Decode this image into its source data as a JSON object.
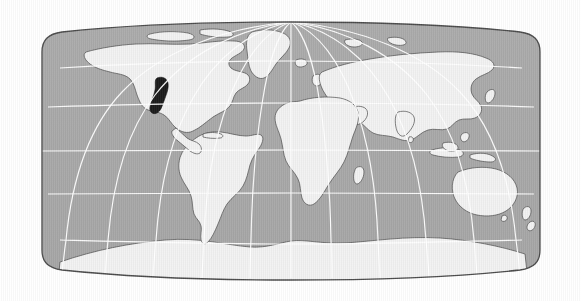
{
  "figure": {
    "kind": "world-map",
    "projection": "robinson",
    "background_color": "#ffffff"
  },
  "map": {
    "bounds": {
      "x": 42,
      "y": 22,
      "width": 498,
      "height": 258
    },
    "ocean_color": "#a9a9a9",
    "land_color": "#f2f2f2",
    "coastline_color": "#4a4a4a",
    "graticule_color": "#ffffff",
    "outline_color": "#4a4a4a",
    "highlight_color": "#1a1a1a"
  },
  "graticule": {
    "visible": true,
    "parallels": [
      {
        "label": "60N",
        "degrees": 60,
        "y": 68
      },
      {
        "label": "30N",
        "degrees": 30,
        "y": 107
      },
      {
        "label": "0",
        "degrees": 0,
        "y": 151
      },
      {
        "label": "30S",
        "degrees": -30,
        "y": 194
      },
      {
        "label": "60S",
        "degrees": -60,
        "y": 240
      }
    ],
    "meridians": [
      {
        "label": "150W",
        "degrees": -150
      },
      {
        "label": "120W",
        "degrees": -120
      },
      {
        "label": "90W",
        "degrees": -90
      },
      {
        "label": "60W",
        "degrees": -60
      },
      {
        "label": "30W",
        "degrees": -30
      },
      {
        "label": "0",
        "degrees": 0
      },
      {
        "label": "30E",
        "degrees": 30
      },
      {
        "label": "60E",
        "degrees": 60
      },
      {
        "label": "90E",
        "degrees": 90
      },
      {
        "label": "120E",
        "degrees": 120
      },
      {
        "label": "150E",
        "degrees": 150
      }
    ],
    "interval_degrees": 30
  },
  "highlight": {
    "name": "highlighted-region",
    "description": "Filled dark region over the western and central United States",
    "fill": "#1a1a1a",
    "bbox": {
      "x": 150,
      "y": 77,
      "width": 20,
      "height": 37
    }
  },
  "landmasses": [
    {
      "name": "north-america"
    },
    {
      "name": "south-america"
    },
    {
      "name": "greenland"
    },
    {
      "name": "europe"
    },
    {
      "name": "africa"
    },
    {
      "name": "asia"
    },
    {
      "name": "australia"
    },
    {
      "name": "antarctica"
    },
    {
      "name": "new-zealand"
    },
    {
      "name": "japan"
    },
    {
      "name": "madagascar"
    },
    {
      "name": "british-isles"
    },
    {
      "name": "iceland"
    },
    {
      "name": "indonesia"
    },
    {
      "name": "new-guinea"
    }
  ]
}
